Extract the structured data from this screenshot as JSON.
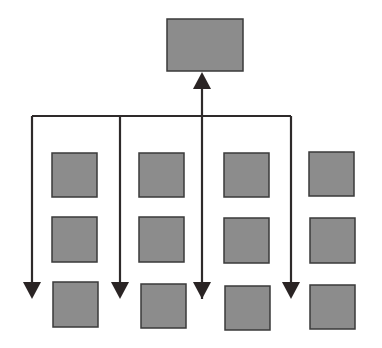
{
  "diagram": {
    "type": "hierarchy-distribution",
    "colors": {
      "box_fill": "#8c8c8c",
      "box_stroke": "#3a3a3a",
      "line": "#2e2a2a",
      "arrowhead": "#2a2424",
      "background": "#ffffff"
    },
    "top_box": {
      "x": 167,
      "y": 19,
      "w": 76,
      "h": 52
    },
    "bus": {
      "y": 116,
      "x_start": 32,
      "x_end": 291
    },
    "up_arrow": {
      "x": 202,
      "tip_y": 72,
      "bottom_y": 299
    },
    "down_arrows": [
      {
        "x": 32,
        "tip_y": 299
      },
      {
        "x": 120,
        "tip_y": 299
      },
      {
        "x": 291,
        "tip_y": 299
      }
    ],
    "columns": [
      {
        "boxes": [
          {
            "x": 52,
            "y": 153,
            "w": 45,
            "h": 44
          },
          {
            "x": 52,
            "y": 217,
            "w": 45,
            "h": 45
          },
          {
            "x": 53,
            "y": 282,
            "w": 45,
            "h": 45
          }
        ]
      },
      {
        "boxes": [
          {
            "x": 139,
            "y": 153,
            "w": 45,
            "h": 44
          },
          {
            "x": 139,
            "y": 217,
            "w": 45,
            "h": 45
          },
          {
            "x": 141,
            "y": 284,
            "w": 45,
            "h": 44
          }
        ]
      },
      {
        "boxes": [
          {
            "x": 224,
            "y": 153,
            "w": 45,
            "h": 44
          },
          {
            "x": 224,
            "y": 218,
            "w": 45,
            "h": 45
          },
          {
            "x": 225,
            "y": 286,
            "w": 45,
            "h": 44
          }
        ]
      },
      {
        "boxes": [
          {
            "x": 309,
            "y": 152,
            "w": 45,
            "h": 44
          },
          {
            "x": 310,
            "y": 218,
            "w": 45,
            "h": 45
          },
          {
            "x": 310,
            "y": 285,
            "w": 45,
            "h": 44
          }
        ]
      }
    ]
  }
}
